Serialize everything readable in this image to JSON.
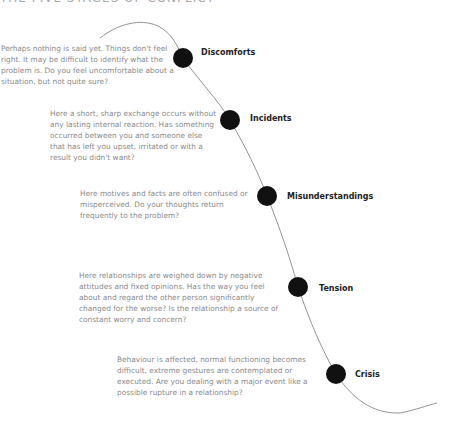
{
  "title": "THE FIVE STAGES OF CONFLICT",
  "colors": {
    "dot": "#111111",
    "curve": "#888888",
    "label": "#222222",
    "description": "#8a8a8a"
  },
  "stages": [
    {
      "label": "Discomforts",
      "description": "Perhaps nothing is said yet. Things don't feel right. It may be difficult to identify what the problem is. Do you feel uncomfortable about a situation, but not quite sure?"
    },
    {
      "label": "Incidents",
      "description": "Here a short, sharp exchange occurs without any lasting internal reaction. Has something occurred between you and someone else that has left you upset, irritated or with a result you didn't want?"
    },
    {
      "label": "Misunderstandings",
      "description": "Here motives and facts are often confused or misperceived. Do your thoughts return frequently to the problem?"
    },
    {
      "label": "Tension",
      "description": "Here relationships are weighed down by negative attitudes and fixed opinions. Has the way you feel about and regard the other person significantly changed for the worse? Is the relationship a source of constant worry and concern?"
    },
    {
      "label": "Crisis",
      "description": "Behaviour is affected, normal functioning becomes difficult, extreme gestures are contemplated or executed. Are you dealing with a major event like a possible rupture in a relationship?"
    }
  ]
}
